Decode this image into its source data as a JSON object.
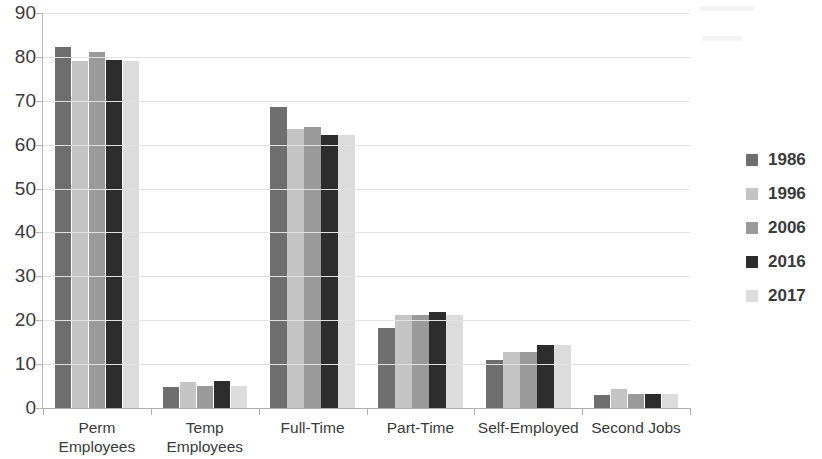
{
  "chart_data": {
    "type": "bar",
    "title": "",
    "subtitle": "",
    "xlabel": "",
    "ylabel": "",
    "ylim": [
      0,
      90
    ],
    "ytick_step": 10,
    "yticks": [
      0,
      10,
      20,
      30,
      40,
      50,
      60,
      70,
      80,
      90
    ],
    "ytick_labels": [
      "0",
      "10",
      "20",
      "30",
      "40",
      "50",
      "60",
      "70",
      "80",
      "90"
    ],
    "grid": true,
    "grid_axis": "y",
    "legend_position": "right",
    "categories": [
      "Perm Employees",
      "Temp Employees",
      "Full-Time",
      "Part-Time",
      "Self-Employed",
      "Second Jobs"
    ],
    "category_lines": [
      [
        "Perm",
        "Employees"
      ],
      [
        "Temp",
        "Employees"
      ],
      [
        "Full-Time"
      ],
      [
        "Part-Time"
      ],
      [
        "Self-Employed"
      ],
      [
        "Second Jobs"
      ]
    ],
    "series": [
      {
        "name": "1986",
        "color": "#6e6e6e",
        "values": [
          82.3,
          4.7,
          68.5,
          18.3,
          11.0,
          3.0
        ]
      },
      {
        "name": "1996",
        "color": "#c4c4c4",
        "values": [
          79.0,
          6.0,
          63.5,
          21.2,
          12.7,
          4.4
        ]
      },
      {
        "name": "2006",
        "color": "#9a9a9a",
        "values": [
          81.1,
          5.1,
          64.0,
          21.2,
          12.8,
          3.3
        ]
      },
      {
        "name": "2016",
        "color": "#2d2d2d",
        "values": [
          79.2,
          6.1,
          62.1,
          21.9,
          14.4,
          3.3
        ]
      },
      {
        "name": "2017",
        "color": "#dcdcdc",
        "values": [
          79.0,
          5.0,
          62.1,
          21.2,
          14.4,
          3.2
        ]
      }
    ]
  },
  "legend": {
    "entries": [
      {
        "label": "1986",
        "color": "#6e6e6e"
      },
      {
        "label": "1996",
        "color": "#c4c4c4"
      },
      {
        "label": "2006",
        "color": "#9a9a9a"
      },
      {
        "label": "2016",
        "color": "#2d2d2d"
      },
      {
        "label": "2017",
        "color": "#dcdcdc"
      }
    ]
  },
  "axes": {
    "y_tick_labels": [
      "90",
      "80",
      "70",
      "60",
      "50",
      "40",
      "30",
      "20",
      "10",
      "0"
    ]
  }
}
